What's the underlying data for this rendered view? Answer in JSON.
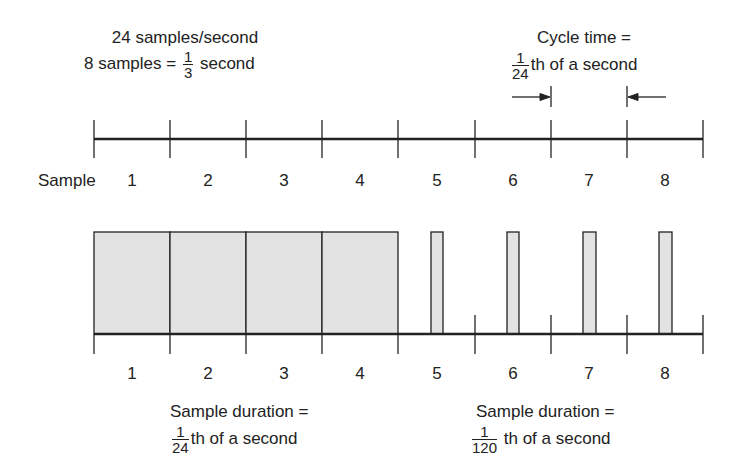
{
  "top_annotation": {
    "line1": "24 samples/second",
    "line2_prefix": "8 samples =",
    "line2_frac_num": "1",
    "line2_frac_den": "3",
    "line2_suffix": "second"
  },
  "cycle_annotation": {
    "line1": "Cycle time =",
    "frac_num": "1",
    "frac_den": "24",
    "suffix": "th of a second"
  },
  "top_axis": {
    "row_label": "Sample",
    "labels": [
      "1",
      "2",
      "3",
      "4",
      "5",
      "6",
      "7",
      "8"
    ]
  },
  "bottom_axis": {
    "labels": [
      "1",
      "2",
      "3",
      "4",
      "5",
      "6",
      "7",
      "8"
    ]
  },
  "left_caption": {
    "line1": "Sample duration =",
    "frac_num": "1",
    "frac_den": "24",
    "suffix": "th of a second"
  },
  "right_caption": {
    "line1": "Sample duration =",
    "frac_num": "1",
    "frac_den": "120",
    "suffix": "th of a second"
  },
  "colors": {
    "line": "#222222",
    "fill": "#e3e3e3"
  }
}
